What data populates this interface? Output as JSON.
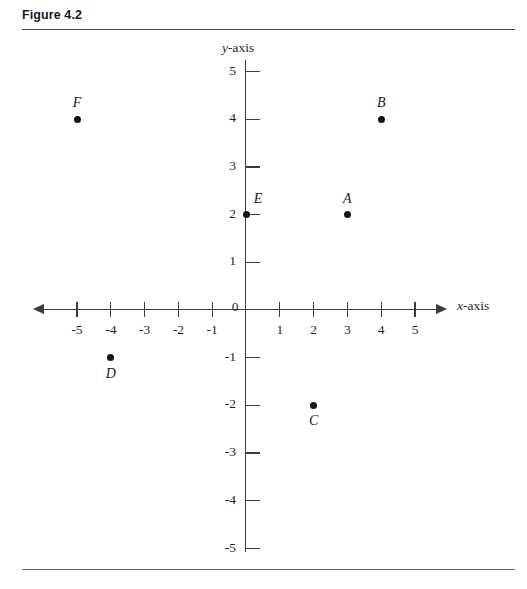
{
  "figure": {
    "title": "Figure 4.2"
  },
  "chart_data": {
    "type": "scatter",
    "title": "Figure 4.2",
    "xlabel": "x-axis",
    "ylabel": "y-axis",
    "xlim": [
      -5,
      5
    ],
    "ylim": [
      -5,
      5
    ],
    "grid": false,
    "legend": "none",
    "origin_label": "0",
    "x_ticks": [
      -5,
      -4,
      -3,
      -2,
      -1,
      1,
      2,
      3,
      4,
      5
    ],
    "x_tick_labels": [
      "-5",
      "-4",
      "-3",
      "-2",
      "-1",
      "1",
      "2",
      "3",
      "4",
      "5"
    ],
    "y_ticks": [
      5,
      4,
      3,
      2,
      1,
      -1,
      -2,
      -3,
      -4,
      -5
    ],
    "y_tick_labels": [
      "5",
      "4",
      "3",
      "2",
      "1",
      "-1",
      "-2",
      "-3",
      "-4",
      "-5"
    ],
    "points": [
      {
        "label": "A",
        "x": 3,
        "y": 2,
        "label_position": "above"
      },
      {
        "label": "B",
        "x": 4,
        "y": 4,
        "label_position": "above"
      },
      {
        "label": "C",
        "x": 2,
        "y": -2,
        "label_position": "below"
      },
      {
        "label": "D",
        "x": -4,
        "y": -1,
        "label_position": "below"
      },
      {
        "label": "E",
        "x": 0,
        "y": 2,
        "label_position": "upper-right"
      },
      {
        "label": "F",
        "x": -5,
        "y": 4,
        "label_position": "above"
      }
    ]
  },
  "axis_name_parts": {
    "x_italic": "x",
    "x_rest": "-axis",
    "y_italic": "y",
    "y_rest": "-axis"
  },
  "colors": {
    "ink": "#1a1a1a",
    "axis": "#3a3a3f",
    "rule": "#4a4a4f",
    "point": "#141417"
  }
}
